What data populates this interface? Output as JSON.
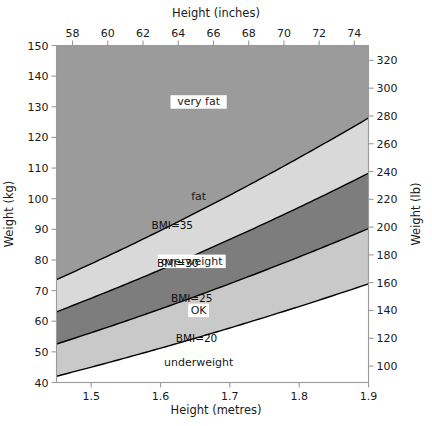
{
  "chart_data": {
    "type": "area",
    "title": "",
    "xlabel": "Height (metres)",
    "ylabel": "Weight (kg)",
    "x2label": "Height (inches)",
    "y2label": "Weight (lb)",
    "xlim": [
      1.45,
      1.9
    ],
    "ylim": [
      40,
      150
    ],
    "x2lim": [
      57.087,
      74.803
    ],
    "y2lim": [
      88.18,
      330.69
    ],
    "grid": false,
    "legend": "none",
    "bottom_ticks": [
      "1.5",
      "1.6",
      "1.7",
      "1.8",
      "1.9"
    ],
    "bottom_tick_values": [
      1.5,
      1.6,
      1.7,
      1.8,
      1.9
    ],
    "left_ticks": [
      "150",
      "140",
      "130",
      "120",
      "110",
      "100",
      "90",
      "80",
      "70",
      "60",
      "50",
      "40"
    ],
    "left_tick_values": [
      150,
      140,
      130,
      120,
      110,
      100,
      90,
      80,
      70,
      60,
      50,
      40
    ],
    "top_ticks": [
      "58",
      "60",
      "62",
      "64",
      "66",
      "68",
      "70",
      "72",
      "74"
    ],
    "top_tick_values": [
      58,
      60,
      62,
      64,
      66,
      68,
      70,
      72,
      74
    ],
    "right_ticks": [
      "320",
      "300",
      "280",
      "260",
      "240",
      "220",
      "200",
      "180",
      "160",
      "140",
      "120",
      "100"
    ],
    "right_tick_values": [
      320,
      300,
      280,
      260,
      240,
      220,
      200,
      180,
      160,
      140,
      120,
      100
    ],
    "boundaries": [
      {
        "name": "BMI=20",
        "bmi": 20,
        "label": "BMI=20"
      },
      {
        "name": "BMI=25",
        "bmi": 25,
        "label": "BMI=25"
      },
      {
        "name": "BMI=30",
        "bmi": 30,
        "label": "BMI=30"
      },
      {
        "name": "BMI=35",
        "bmi": 35,
        "label": "BMI=35"
      }
    ],
    "bands": [
      {
        "name": "underweight",
        "label": "underweight",
        "bmi_min": 0,
        "bmi_max": 20,
        "color": "#ffffff",
        "boxed": false
      },
      {
        "name": "ok",
        "label": "OK",
        "bmi_min": 20,
        "bmi_max": 25,
        "color": "#c9c9c9",
        "boxed": true
      },
      {
        "name": "overweight",
        "label": "overweight",
        "bmi_min": 25,
        "bmi_max": 30,
        "color": "#7d7d7d",
        "boxed": true
      },
      {
        "name": "fat",
        "label": "fat",
        "bmi_min": 30,
        "bmi_max": 35,
        "color": "#d9d9d9",
        "boxed": false
      },
      {
        "name": "very-fat",
        "label": "very fat",
        "bmi_min": 35,
        "bmi_max": 999,
        "color": "#9b9b9b",
        "boxed": true
      }
    ]
  },
  "axes": {
    "bottom_title": "Height (metres)",
    "left_title": "Weight (kg)",
    "top_title": "Height (inches)",
    "right_title": "Weight (lb)"
  },
  "labels": {
    "very_fat": "very fat",
    "fat": "fat",
    "overweight": "overweight",
    "ok": "OK",
    "underweight": "underweight",
    "bmi35": "BMI=35",
    "bmi30": "BMI=30",
    "bmi25": "BMI=25",
    "bmi20": "BMI=20"
  }
}
